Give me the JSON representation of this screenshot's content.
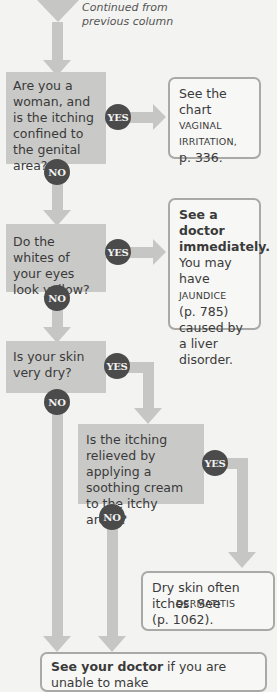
{
  "header": {
    "continued_line1": "Continued from",
    "continued_line2": "previous column"
  },
  "questions": [
    {
      "id": "q1",
      "text": "Are you a woman, and is the itching confined to the genital area?"
    },
    {
      "id": "q2",
      "text": "Do the whites of your eyes look yellow?"
    },
    {
      "id": "q3",
      "text": "Is your skin very dry?"
    },
    {
      "id": "q4",
      "text": "Is the itching relieved by applying a soothing cream to the itchy areas?"
    }
  ],
  "labels": {
    "yes": "YES",
    "no": "NO"
  },
  "answers": {
    "a1": {
      "lead": "See the chart",
      "ref": "VAGINAL IRRITATION,",
      "page": "p. 336."
    },
    "a2": {
      "bold": "See a doctor immediately.",
      "pre": "You may have",
      "ref": "JAUNDICE",
      "post": "(p. 785) caused by a liver disorder."
    },
    "a3": {
      "lead": "Dry skin often itches. See",
      "ref": "DERMATITIS",
      "page": "(p. 1062)."
    },
    "final": {
      "bold": "See your doctor",
      "text": " if you are unable to make"
    }
  },
  "colors": {
    "background": "#f3f3f1",
    "question_fill": "#c9c9c7",
    "connector": "#c6c6c4",
    "badge": "#4b4b4b",
    "answer_border": "#a9a9a7"
  }
}
